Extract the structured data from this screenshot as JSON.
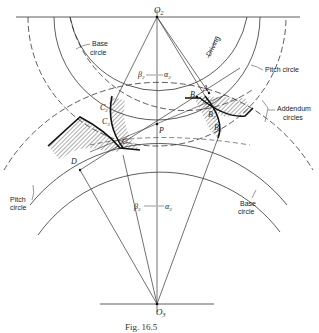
{
  "figure": {
    "caption": "Fig. 16.5",
    "centers": {
      "upper": "O",
      "upper_sub": "2",
      "lower": "O",
      "lower_sub": "3"
    },
    "points": {
      "P": "P",
      "A": "A",
      "B": "B",
      "B2p": "B",
      "B2p_sub": "2",
      "B3p": "B",
      "B3p_sub": "3",
      "C": "C",
      "C2p": "C",
      "C2p_sub": "2",
      "C3p": "C",
      "C3p_sub": "3",
      "D": "D"
    },
    "angles": {
      "beta2": "β",
      "beta2_sub": "2",
      "alpha2": "α",
      "alpha2_sub": "2",
      "beta3": "β",
      "beta3_sub": "3",
      "alpha3": "α",
      "alpha3_sub": "3"
    },
    "labels": {
      "base_circle_top_l1": "Base",
      "base_circle_top_l2": "circle",
      "pitch_circle_top": "Pitch circle",
      "driving": "Driving",
      "addendum_l1": "Addendum",
      "addendum_l2": "circles",
      "pitch_circle_bottom_l1": "Pitch",
      "pitch_circle_bottom_l2": "circle",
      "base_circle_bottom_l1": "Base",
      "base_circle_bottom_l2": "circle"
    }
  }
}
